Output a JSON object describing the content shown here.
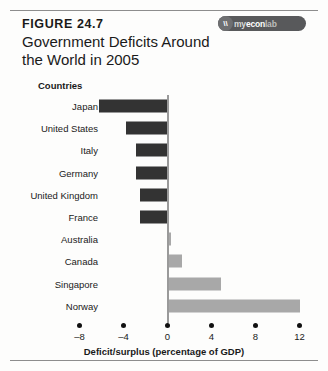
{
  "figure": {
    "number_label": "FIGURE 24.7",
    "title": "Government Deficits Around the World in 2005",
    "logo": {
      "mark": "\\\\",
      "part_my": "my",
      "part_econ": "econ",
      "part_lab": "lab",
      "name": "myeconlab"
    }
  },
  "chart_data": {
    "type": "bar",
    "orientation": "horizontal",
    "title": "Government Deficits Around the World in 2005",
    "xlabel": "Deficit/surplus (percentage of GDP)",
    "ylabel": "Countries",
    "categories": [
      "Japan",
      "United States",
      "Italy",
      "Germany",
      "United Kingdom",
      "France",
      "Australia",
      "Canada",
      "Singapore",
      "Norway"
    ],
    "values": [
      -6.2,
      -3.8,
      -2.9,
      -2.9,
      -2.5,
      -2.5,
      0.3,
      1.3,
      4.9,
      12.0
    ],
    "xlim": [
      -8,
      12
    ],
    "xticks": [
      -8,
      -4,
      0,
      4,
      8,
      12
    ],
    "xtick_labels": [
      "–8",
      "–4",
      "0",
      "4",
      "8",
      "12"
    ],
    "grid": false,
    "legend": false,
    "colors": {
      "negative_bar": "#333333",
      "positive_bar": "#a8a8a8",
      "zero_line": "#9a9a9a",
      "text": "#1a1a1a"
    }
  }
}
